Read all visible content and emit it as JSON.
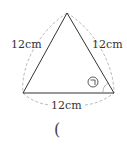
{
  "diagram": {
    "type": "equilateral-triangle",
    "sides": {
      "left": "12cm",
      "right": "12cm",
      "bottom": "12cm"
    },
    "angle_marker": "㉠",
    "answer_paren": "(",
    "colors": {
      "stroke": "#333333",
      "dashed": "#aaaaaa",
      "text": "#333333"
    }
  }
}
